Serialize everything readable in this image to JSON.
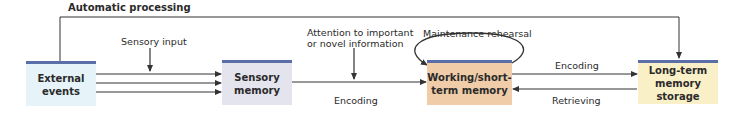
{
  "diagram": {
    "title_label": "Automatic processing",
    "colors": {
      "box_top_border": "#5a6fa8",
      "external_fill": "#e6f3f8",
      "sensory_fill": "#e3e4ee",
      "working_fill": "#f0cca8",
      "longterm_fill": "#faf0c8",
      "line": "#333333"
    },
    "boxes": {
      "external": {
        "line1": "External",
        "line2": "events"
      },
      "sensory": {
        "line1": "Sensory",
        "line2": "memory"
      },
      "working": {
        "line1": "Working/short-",
        "line2": "term memory"
      },
      "longterm": {
        "line1": "Long-term",
        "line2": "memory storage"
      }
    },
    "labels": {
      "sensory_input": "Sensory input",
      "attention_line1": "Attention to important",
      "attention_line2": "or novel information",
      "encoding_1": "Encoding",
      "maintenance": "Maintenance rehearsal",
      "encoding_2": "Encoding",
      "retrieving": "Retrieving"
    }
  }
}
